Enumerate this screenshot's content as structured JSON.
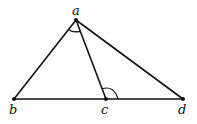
{
  "diagram": {
    "type": "geometry-triangle",
    "points": {
      "a": {
        "label": "a",
        "x": 76,
        "y": 20
      },
      "b": {
        "label": "b",
        "x": 14,
        "y": 99
      },
      "c": {
        "label": "c",
        "x": 106,
        "y": 99
      },
      "d": {
        "label": "d",
        "x": 183,
        "y": 99
      }
    },
    "segments": [
      "ab",
      "ad",
      "ac",
      "bd"
    ],
    "marked_angles": [
      "bac",
      "acd"
    ],
    "stroke_color": "#111111"
  }
}
